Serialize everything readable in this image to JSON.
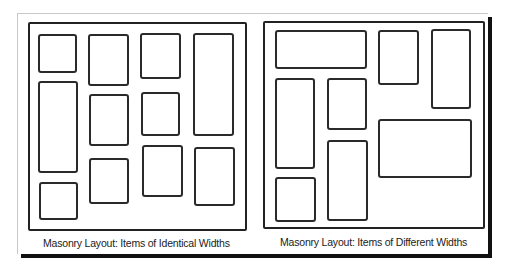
{
  "diagram": {
    "panels": [
      {
        "id": "identical-widths",
        "caption": "Masonry Layout: Items of Identical Widths",
        "item_count": 11,
        "columns": 4
      },
      {
        "id": "different-widths",
        "caption": "Masonry Layout: Items of Different Widths",
        "item_count": 8
      }
    ],
    "colors": {
      "stroke": "#222222",
      "background": "#ffffff",
      "shadow": "#111111"
    }
  }
}
